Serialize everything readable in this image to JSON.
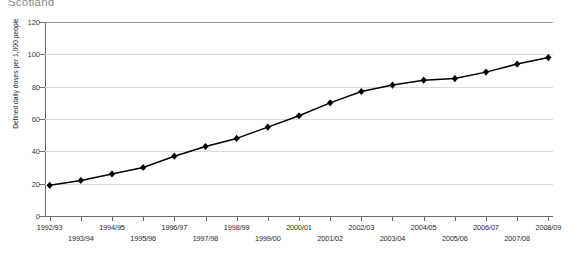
{
  "chart_title": "Scotland",
  "chart_data": {
    "type": "line",
    "title": "Scotland",
    "xlabel": "",
    "ylabel": "Defined daily doses per 1,000 people",
    "ylim": [
      0,
      120
    ],
    "yticks": [
      0,
      20,
      40,
      60,
      80,
      100,
      120
    ],
    "grid": true,
    "legend": "none",
    "marker": "diamond",
    "line_color": "#000000",
    "marker_color": "#000000",
    "grid_color": "#d9d9d9",
    "axis_color": "#6a6a6a",
    "background": "#ffffff",
    "categories": [
      "1992/93",
      "1993/94",
      "1994/95",
      "1995/96",
      "1996/97",
      "1997/98",
      "1998/99",
      "1999/00",
      "2000/01",
      "2001/02",
      "2002/03",
      "2003/04",
      "2004/05",
      "2005/06",
      "2006/07",
      "2007/08",
      "2008/09"
    ],
    "values": [
      19,
      22,
      26,
      30,
      37,
      43,
      48,
      55,
      62,
      70,
      77,
      81,
      84,
      85,
      89,
      94,
      98
    ]
  }
}
